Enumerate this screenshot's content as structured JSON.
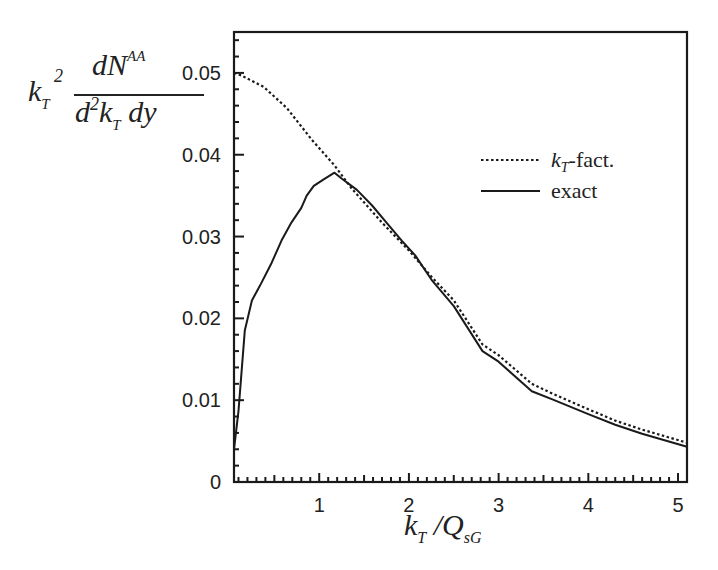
{
  "chart_data": {
    "type": "line",
    "title": "",
    "xlabel": "k_T / Q_sG",
    "ylabel": "k_T^2 dN^AA / (d^2k_T dy)",
    "xlim": [
      0.05,
      5.1
    ],
    "ylim": [
      0,
      0.055
    ],
    "xticks": [
      1,
      2,
      3,
      4,
      5
    ],
    "xtick_labels": [
      "1",
      "2",
      "3",
      "4",
      "5"
    ],
    "yticks": [
      0,
      0.01,
      0.02,
      0.03,
      0.04,
      0.05
    ],
    "ytick_labels": [
      "0",
      "0.01",
      "0.02",
      "0.03",
      "0.04",
      "0.05"
    ],
    "grid": false,
    "legend_position": "upper-right",
    "series": [
      {
        "name": "kT-fact.",
        "style": "dotted",
        "x": [
          0.05,
          0.13,
          0.38,
          0.64,
          0.92,
          1.17,
          1.36,
          1.7,
          2.0,
          2.26,
          2.5,
          2.82,
          3.0,
          3.37,
          3.6,
          4.0,
          4.3,
          4.6,
          5.1
        ],
        "y": [
          0.05,
          0.0497,
          0.0483,
          0.0457,
          0.0418,
          0.0387,
          0.0359,
          0.0317,
          0.0283,
          0.025,
          0.0222,
          0.0168,
          0.0155,
          0.012,
          0.0108,
          0.0089,
          0.0075,
          0.0064,
          0.0048
        ]
      },
      {
        "name": "exact",
        "style": "solid",
        "x": [
          0.05,
          0.1,
          0.17,
          0.25,
          0.34,
          0.47,
          0.58,
          0.69,
          0.8,
          0.86,
          0.94,
          1.05,
          1.17,
          1.25,
          1.42,
          1.59,
          1.75,
          1.92,
          2.07,
          2.26,
          2.5,
          2.82,
          3.0,
          3.37,
          3.6,
          4.0,
          4.3,
          4.6,
          5.1
        ],
        "y": [
          0.004,
          0.0087,
          0.0185,
          0.0222,
          0.024,
          0.0268,
          0.0295,
          0.0317,
          0.0335,
          0.035,
          0.0362,
          0.037,
          0.0378,
          0.0371,
          0.0357,
          0.0338,
          0.0317,
          0.0295,
          0.0277,
          0.0246,
          0.0215,
          0.016,
          0.0147,
          0.0111,
          0.0101,
          0.0083,
          0.007,
          0.0059,
          0.0043
        ]
      }
    ]
  },
  "labels": {
    "y_k": "k",
    "y_k_sub": "T",
    "y_k_sup": "2",
    "y_num": "dN",
    "y_num_sup": "AA",
    "y_den_d": "d",
    "y_den_sup": "2",
    "y_den_k": "k",
    "y_den_sub": "T",
    "y_den_rest": " dy",
    "x_k": "k",
    "x_k_sub": "T",
    "x_rest": " /Q",
    "x_rest_sub": "sG"
  }
}
